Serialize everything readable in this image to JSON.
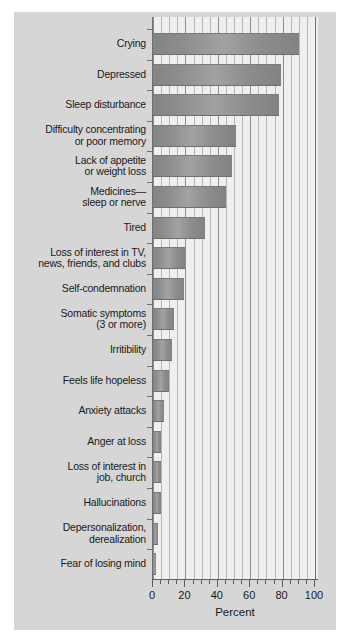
{
  "chart_data": {
    "type": "bar",
    "orientation": "horizontal",
    "title": "",
    "xlabel": "Percent",
    "ylabel": "",
    "xlim": [
      0,
      100
    ],
    "ylim": null,
    "grid": true,
    "legend": null,
    "xticks": [
      0,
      20,
      40,
      60,
      80,
      100
    ],
    "xtick_labels": [
      "0",
      "20",
      "40",
      "60",
      "80",
      "100"
    ],
    "minor_tick_step": 5,
    "categories": [
      "Crying",
      "Depressed",
      "Sleep disturbance",
      "Difficulty concentrating\nor poor memory",
      "Lack of appetite\nor weight loss",
      "Medicines—\nsleep or nerve",
      "Tired",
      "Loss of interest in TV,\nnews, friends, and clubs",
      "Self-condemnation",
      "Somatic symptoms\n(3 or more)",
      "Irritibility",
      "Feels life hopeless",
      "Anxiety attacks",
      "Anger at loss",
      "Loss of interest in\njob, church",
      "Hallucinations",
      "Depersonalization,\nderealization",
      "Fear of losing mind"
    ],
    "values": [
      90,
      79,
      78,
      51,
      49,
      45,
      32,
      20,
      19,
      13,
      12,
      10,
      7,
      5,
      5,
      5,
      3,
      2
    ],
    "bar_color": "#8f8f8f",
    "plot_background": "#efefef",
    "panel_background": "#d6d6d6",
    "axis_color": "#5d5d5d"
  }
}
